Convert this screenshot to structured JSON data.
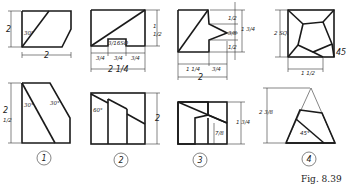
{
  "figure": {
    "caption": "Fig. 8.39",
    "problems": [
      {
        "number": "1",
        "top_view": {
          "height_dim": "2",
          "angle": "30°",
          "width_dim": "2"
        },
        "front_view": {
          "height_dim": "2 1/2",
          "angle_left": "30°",
          "angle_right": "30°"
        }
      },
      {
        "number": "2",
        "top_view": {
          "height_dim": "1 1/2",
          "slot_label": "3/16 SQ.",
          "dims_bottom": [
            "3/4",
            "3/4",
            "3/4"
          ],
          "overall": "2 1/4"
        },
        "front_view": {
          "angle": "60°",
          "height_dim": "2"
        }
      },
      {
        "number": "3",
        "top_view": {
          "dims_right": [
            "1/2",
            "3/8",
            "1/2"
          ],
          "overall_right": "1 3/4",
          "dims_bottom": [
            "1 1/4",
            "3/4"
          ],
          "overall": "2"
        },
        "front_view": {
          "height_dim": "1 3/4",
          "inner_dim": "7/8"
        }
      },
      {
        "number": "4",
        "top_view": {
          "size": "2 SQ.",
          "angle": "45",
          "bottom_dim": "1 1/2"
        },
        "front_view": {
          "height_dim": "2 3/8",
          "angle": "45°"
        }
      }
    ]
  },
  "labels": {
    "p1_top_h": "2",
    "p1_top_ang": "30°",
    "p1_w": "2",
    "p1_front_h": "2",
    "p1_front_h2": "1/2",
    "p1_front_a1": "30°",
    "p1_front_a2": "30°",
    "p2_top_h": "1/2",
    "p2_top_h1": "1",
    "p2_sq": "3/16SQ",
    "p2_d1": "3/4",
    "p2_d2": "3/4",
    "p2_d3": "3/4",
    "p2_overall": "2 1/4",
    "p2_ang": "60°",
    "p2_front_h": "2",
    "p3_r1": "1/2",
    "p3_r2": "3/8",
    "p3_r3": "1/2",
    "p3_overall_r": "1 3/4",
    "p3_b1": "1 1/4",
    "p3_b2": "3/4",
    "p3_overall": "2",
    "p3_front_h": "1 3/4",
    "p3_inner": "7/8",
    "p4_sq": "2 SQ.",
    "p4_ang": "45",
    "p4_bottom": "1 1/2",
    "p4_front_h": "2 3/8",
    "p4_front_ang": "45°",
    "n1": "1",
    "n2": "2",
    "n3": "3",
    "n4": "4"
  }
}
